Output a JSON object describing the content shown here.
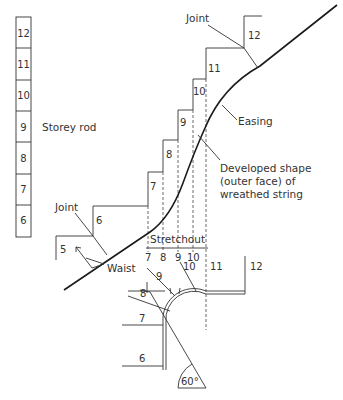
{
  "storey_rod": {
    "label": "Storey rod",
    "divisions": [
      "12",
      "11",
      "10",
      "9",
      "8",
      "7",
      "6"
    ]
  },
  "labels": {
    "joint_upper": "Joint",
    "joint_lower": "Joint",
    "easing": "Easing",
    "developed_line1": "Developed shape",
    "developed_line2": "(outer face) of",
    "developed_line3": "wreathed string",
    "waist": "Waist",
    "stretchout": "Stretchout",
    "angle": "60°"
  },
  "elevation_steps": {
    "risers": [
      "5",
      "6",
      "7",
      "8",
      "9",
      "10",
      "11",
      "12"
    ]
  },
  "stretchout_ticks": [
    "7",
    "8",
    "9",
    "10"
  ],
  "plan": {
    "step_labels": [
      "6",
      "7",
      "8",
      "9",
      "10",
      "11",
      "12"
    ]
  }
}
